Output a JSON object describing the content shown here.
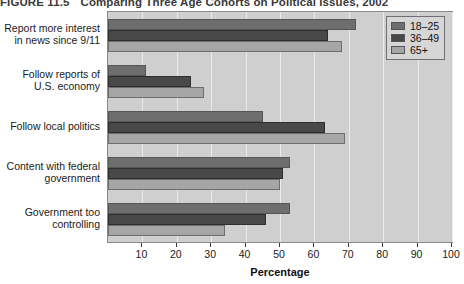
{
  "figure": {
    "label": "FIGURE 11.5",
    "title": "Comparing Three Age Cohorts on Political Issues, 2002"
  },
  "legend": {
    "position": "top-right",
    "entries": [
      {
        "label": "18–25",
        "color": "#6e6e6e"
      },
      {
        "label": "36–49",
        "color": "#484848"
      },
      {
        "label": "65+",
        "color": "#a6a6a6"
      }
    ]
  },
  "chart_data": {
    "type": "bar",
    "orientation": "horizontal",
    "title": "Comparing Three Age Cohorts on Political Issues, 2002",
    "xlabel": "Percentage",
    "ylabel": "",
    "xlim": [
      0,
      100
    ],
    "xticks": [
      10,
      20,
      30,
      40,
      50,
      60,
      70,
      80,
      90,
      100
    ],
    "grid": true,
    "categories": [
      "Report more interest in news since 9/11",
      "Follow reports of U.S. economy",
      "Follow local politics",
      "Content with federal government",
      "Government too controlling"
    ],
    "series": [
      {
        "name": "18–25",
        "color": "#6e6e6e",
        "values": [
          72,
          11,
          45,
          53,
          53
        ]
      },
      {
        "name": "36–49",
        "color": "#484848",
        "values": [
          64,
          24,
          63,
          51,
          46
        ]
      },
      {
        "name": "65+",
        "color": "#a6a6a6",
        "values": [
          68,
          28,
          69,
          50,
          34
        ]
      }
    ]
  },
  "category_lines": [
    [
      "Report more interest",
      "in news since 9/11"
    ],
    [
      "Follow reports of",
      "U.S. economy"
    ],
    [
      "Follow local politics"
    ],
    [
      "Content with federal",
      "government"
    ],
    [
      "Government too",
      "controlling"
    ]
  ]
}
